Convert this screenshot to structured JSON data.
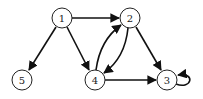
{
  "diagram": {
    "type": "directed-graph",
    "nodes": [
      {
        "id": "1",
        "label": "1",
        "x": 62,
        "y": 18
      },
      {
        "id": "2",
        "label": "2",
        "x": 130,
        "y": 18
      },
      {
        "id": "3",
        "label": "3",
        "x": 167,
        "y": 80
      },
      {
        "id": "4",
        "label": "4",
        "x": 95,
        "y": 80
      },
      {
        "id": "5",
        "label": "5",
        "x": 22,
        "y": 80
      }
    ],
    "edges": [
      {
        "from": "1",
        "to": "2"
      },
      {
        "from": "1",
        "to": "5"
      },
      {
        "from": "1",
        "to": "4"
      },
      {
        "from": "2",
        "to": "4"
      },
      {
        "from": "4",
        "to": "2"
      },
      {
        "from": "2",
        "to": "3"
      },
      {
        "from": "4",
        "to": "3"
      },
      {
        "from": "3",
        "to": "3"
      }
    ]
  }
}
